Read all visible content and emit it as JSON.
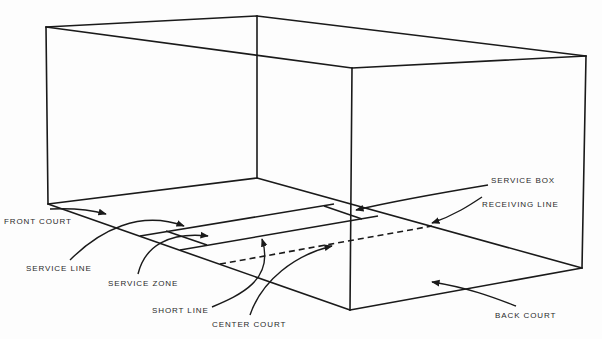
{
  "diagram": {
    "colors": {
      "line": "#1a1a1a",
      "text": "#2a2a2a",
      "background": "#fdfdfd"
    },
    "labels": {
      "front_court": "FRONT COURT",
      "service_line": "SERVICE LINE",
      "service_zone": "SERVICE ZONE",
      "short_line": "SHORT LINE",
      "center_court": "CENTER COURT",
      "service_box": "SERVICE BOX",
      "receiving_line": "RECEIVING LINE",
      "back_court": "BACK COURT"
    }
  }
}
